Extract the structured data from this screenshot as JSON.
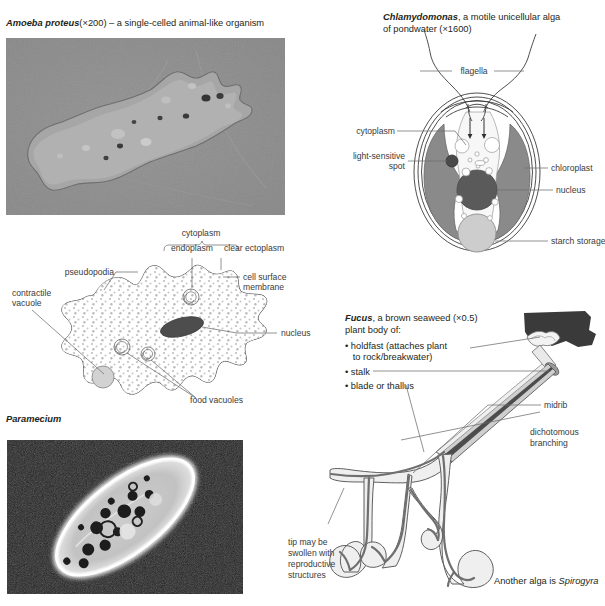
{
  "page": {
    "background": "#ffffff"
  },
  "panels": {
    "amoeba_photo": {
      "name": "Amoeba proteus",
      "magnification": "(×200)",
      "caption_rest": " – a single-celled animal-like organism",
      "image_kind": "light-micrograph",
      "bg_color": "#8c8c8c"
    },
    "chlamydomonas": {
      "name": "Chlamydomonas",
      "caption_line1_rest": ", a motile unicellular alga",
      "caption_line2": "of pondwater (×1600)",
      "labels": {
        "flagella": "flagella",
        "cytoplasm": "cytoplasm",
        "light_sensitive_spot_line1": "light-sensitive",
        "light_sensitive_spot_line2": "spot",
        "chloroplast": "chloroplast",
        "nucleus": "nucleus",
        "starch_storage": "starch storage"
      },
      "colors": {
        "chloroplast": "#8a8a8a",
        "nucleus": "#5a5a5a",
        "eyespot": "#4a4a4a",
        "starch": "#cdcdcd",
        "cytoplasm": "#f7f7f7"
      }
    },
    "amoeba_diagram": {
      "labels": {
        "cytoplasm": "cytoplasm",
        "endoplasm": "endoplasm",
        "clear_ectoplasm": "clear ectoplasm",
        "pseudopodia": "pseudopodia",
        "cell_surface_line1": "cell surface",
        "cell_surface_line2": "membrane",
        "contractile_line1": "contractile",
        "contractile_line2": "vacuole",
        "nucleus": "nucleus",
        "food_vacuoles": "food vacuoles"
      },
      "colors": {
        "nucleus": "#4d4d4d",
        "vacuole": "#d2d2d2",
        "stipple": "#b9b9b9"
      }
    },
    "paramecium_photo": {
      "name": "Paramecium",
      "image_kind": "dark-field micrograph",
      "bg_color": "#1a1a1a"
    },
    "fucus": {
      "name": "Fucus",
      "caption_line1_rest": ", a brown seaweed (×0.5)",
      "caption_line2": "plant body of:",
      "bullets": [
        "• holdfast (attaches plant",
        "   to rock/breakwater)",
        "• stalk",
        "• blade or thallus"
      ],
      "labels": {
        "midrib": "midrib",
        "dichotomous_line1": "dichotomous",
        "dichotomous_line2": "branching",
        "tip_line1": "tip may be",
        "tip_line2": "swollen with",
        "tip_line3": "reproductive",
        "tip_line4": "structures"
      },
      "footnote_prefix": "Another alga is ",
      "footnote_italic": "Spirogyra",
      "colors": {
        "rock": "#3a3a3a",
        "midrib": "#6f6f6f",
        "frond": "#ededed"
      }
    }
  }
}
